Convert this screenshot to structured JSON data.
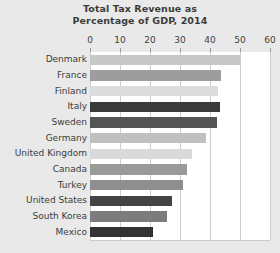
{
  "chart_data": {
    "type": "bar",
    "orientation": "horizontal",
    "title": "Total Tax Revenue as Percentage of GDP, 2014",
    "title_lines": [
      "Total Tax Revenue as",
      "Percentage of GDP, 2014"
    ],
    "xlabel": "",
    "ylabel": "",
    "xlim": [
      0,
      60
    ],
    "xticks": [
      0,
      10,
      20,
      30,
      40,
      50,
      60
    ],
    "xtick_labels": [
      "0",
      "10",
      "20",
      "30",
      "40",
      "50",
      "60"
    ],
    "grid": true,
    "grid_axis": "x",
    "legend": "none",
    "categories": [
      "Denmark",
      "France",
      "Finland",
      "Italy",
      "Sweden",
      "Germany",
      "United Kingdom",
      "Canada",
      "Turkey",
      "United States",
      "South Korea",
      "Mexico"
    ],
    "values": [
      50.0,
      43.7,
      42.6,
      43.4,
      42.3,
      38.7,
      34.0,
      32.3,
      31.0,
      27.3,
      25.7,
      21.0
    ],
    "bar_colors": [
      "#c8c8c8",
      "#9d9d9d",
      "#dcdcdc",
      "#3a3a3a",
      "#545454",
      "#c0c0c0",
      "#dadada",
      "#9a9a9a",
      "#8e8e8e",
      "#434343",
      "#7c7c7c",
      "#333333"
    ],
    "bars": [
      {
        "category": "Denmark",
        "value": 50.0,
        "color": "#c8c8c8"
      },
      {
        "category": "France",
        "value": 43.7,
        "color": "#9d9d9d"
      },
      {
        "category": "Finland",
        "value": 42.6,
        "color": "#dcdcdc"
      },
      {
        "category": "Italy",
        "value": 43.4,
        "color": "#3a3a3a"
      },
      {
        "category": "Sweden",
        "value": 42.3,
        "color": "#545454"
      },
      {
        "category": "Germany",
        "value": 38.7,
        "color": "#c0c0c0"
      },
      {
        "category": "United Kingdom",
        "value": 34.0,
        "color": "#dadada"
      },
      {
        "category": "Canada",
        "value": 32.3,
        "color": "#9a9a9a"
      },
      {
        "category": "Turkey",
        "value": 31.0,
        "color": "#8e8e8e"
      },
      {
        "category": "United States",
        "value": 27.3,
        "color": "#434343"
      },
      {
        "category": "South Korea",
        "value": 25.7,
        "color": "#7c7c7c"
      },
      {
        "category": "Mexico",
        "value": 21.0,
        "color": "#333333"
      }
    ]
  },
  "style": {
    "page_background": "#e9e9e9",
    "plot_background": "#ffffff",
    "grid_color": "#cdcdcd",
    "text_color": "#3b3b3b"
  }
}
